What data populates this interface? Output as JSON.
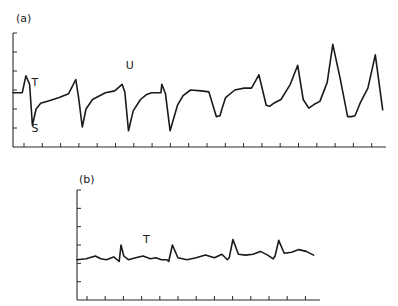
{
  "chart_data": [
    {
      "type": "line",
      "panel_label": "(a)",
      "title": "",
      "xlabel": "",
      "ylabel": "",
      "grid": false,
      "x_ticks": 20,
      "y_ticks": 6,
      "xlim": [
        0,
        20
      ],
      "ylim": [
        0,
        6
      ],
      "annotations": [
        {
          "text": "T",
          "x": 1.0,
          "y": 3.2
        },
        {
          "text": "S",
          "x": 1.0,
          "y": 0.8
        },
        {
          "text": "U",
          "x": 6.1,
          "y": 4.1
        }
      ],
      "series": [
        {
          "name": "trace",
          "x": [
            0,
            0.5,
            0.7,
            0.9,
            1.05,
            1.25,
            1.5,
            2,
            2.5,
            3,
            3.4,
            3.55,
            3.75,
            3.95,
            4.3,
            5,
            5.5,
            5.9,
            6.05,
            6.25,
            6.5,
            6.9,
            7.2,
            7.5,
            8,
            8.05,
            8.25,
            8.5,
            8.9,
            9.2,
            9.6,
            10.2,
            10.6,
            11,
            11.2,
            11.3,
            11.5,
            12,
            12.5,
            12.9,
            13.3,
            13.7,
            13.9,
            14.1,
            14.5,
            15,
            15.4,
            15.7,
            16.0,
            16.3,
            16.6,
            17,
            17.3,
            17.7,
            18.1,
            18.3,
            18.5,
            18.8,
            19.2,
            19.6,
            20
          ],
          "y": [
            2.85,
            2.85,
            3.75,
            3.3,
            1.15,
            2.0,
            2.3,
            2.45,
            2.6,
            2.8,
            3.55,
            2.6,
            1.05,
            2.0,
            2.5,
            2.85,
            2.95,
            3.3,
            2.9,
            0.85,
            1.9,
            2.5,
            2.75,
            2.85,
            2.85,
            3.3,
            2.8,
            0.85,
            2.2,
            2.7,
            3.0,
            2.95,
            2.9,
            1.6,
            1.65,
            2.0,
            2.6,
            3.0,
            3.1,
            3.1,
            3.8,
            2.2,
            2.15,
            2.3,
            2.5,
            3.3,
            4.3,
            2.5,
            2.05,
            2.25,
            2.4,
            3.4,
            5.4,
            3.6,
            1.6,
            1.6,
            1.65,
            2.35,
            3.1,
            4.85,
            1.95
          ]
        }
      ]
    },
    {
      "type": "line",
      "panel_label": "(b)",
      "title": "",
      "xlabel": "",
      "ylabel": "",
      "grid": false,
      "x_ticks": 13,
      "y_ticks": 6,
      "xlim": [
        0,
        13
      ],
      "ylim": [
        0,
        6
      ],
      "annotations": [
        {
          "text": "T",
          "x": 3.6,
          "y": 3.1
        }
      ],
      "series": [
        {
          "name": "trace",
          "x": [
            0,
            0.5,
            1.0,
            1.3,
            1.6,
            2.0,
            2.3,
            2.4,
            2.55,
            2.8,
            3.2,
            3.6,
            4.0,
            4.3,
            4.6,
            4.9,
            5.0,
            5.2,
            5.5,
            6.0,
            6.5,
            7.0,
            7.5,
            7.9,
            8.2,
            8.3,
            8.5,
            8.8,
            9.2,
            9.6,
            10.0,
            10.4,
            10.7,
            10.8,
            11.0,
            11.3,
            11.7,
            12.1,
            12.5,
            12.9
          ],
          "y": [
            2.2,
            2.25,
            2.4,
            2.25,
            2.2,
            2.35,
            2.1,
            3.0,
            2.4,
            2.2,
            2.3,
            2.4,
            2.25,
            2.3,
            2.2,
            2.2,
            2.1,
            3.0,
            2.3,
            2.2,
            2.3,
            2.45,
            2.3,
            2.5,
            2.2,
            2.3,
            3.3,
            2.5,
            2.45,
            2.5,
            2.65,
            2.45,
            2.25,
            2.4,
            3.25,
            2.55,
            2.6,
            2.75,
            2.65,
            2.45
          ]
        }
      ]
    }
  ]
}
